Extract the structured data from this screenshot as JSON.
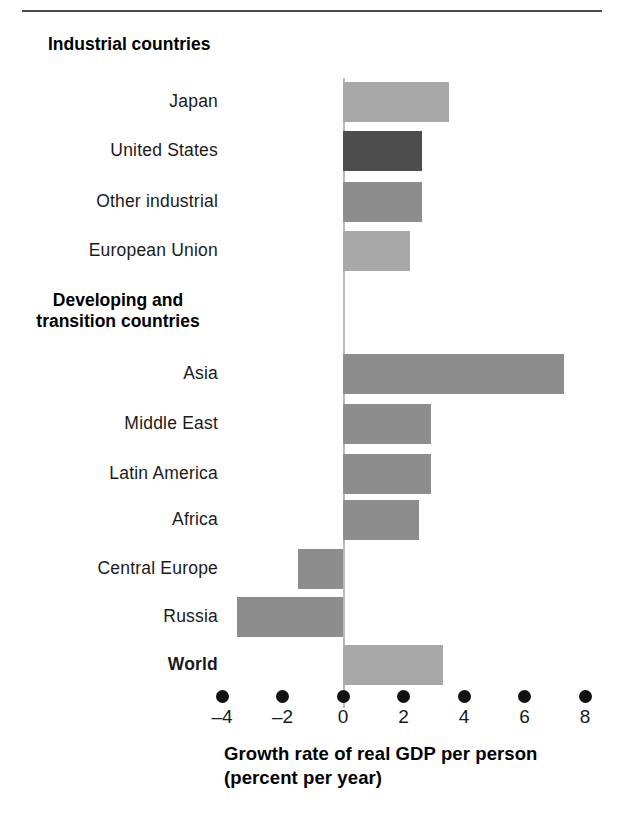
{
  "figure": {
    "axis_title_line1": "Growth rate of real GDP per person",
    "axis_title_line2": "(percent per year)",
    "group_headings": [
      {
        "id": "industrial",
        "text": "Industrial countries"
      },
      {
        "id": "developing",
        "line1": "Developing and",
        "line2": "transition countries"
      }
    ],
    "colors": {
      "bar_light": "#a8a8a8",
      "bar_medium": "#8d8d8d",
      "bar_dark": "#4d4d4d",
      "axis_line": "#b9b9b9",
      "rule": "#4c4c4c",
      "text": "#111111"
    }
  },
  "chart_data": {
    "type": "bar",
    "orientation": "horizontal",
    "title": "",
    "xlabel": "Growth rate of real GDP per person (percent per year)",
    "ylabel": "",
    "xlim": [
      -5,
      8.8
    ],
    "xticks": [
      -4,
      -2,
      0,
      2,
      4,
      6,
      8
    ],
    "xtick_labels": [
      "–4",
      "–2",
      "0",
      "2",
      "4",
      "6",
      "8"
    ],
    "grid": false,
    "legend": null,
    "categories": [
      "Japan",
      "United States",
      "Other industrial",
      "European Union",
      "Asia",
      "Middle East",
      "Latin America",
      "Africa",
      "Central Europe",
      "Russia",
      "World"
    ],
    "values": [
      3.5,
      2.6,
      2.6,
      2.2,
      7.3,
      2.9,
      2.9,
      2.5,
      -1.5,
      -3.5,
      3.3
    ],
    "bar_colors": [
      "#a8a8a8",
      "#4d4d4d",
      "#8d8d8d",
      "#a8a8a8",
      "#8d8d8d",
      "#8d8d8d",
      "#8d8d8d",
      "#8d8d8d",
      "#8d8d8d",
      "#8d8d8d",
      "#a8a8a8"
    ],
    "label_bold": [
      false,
      false,
      false,
      false,
      false,
      false,
      false,
      false,
      false,
      false,
      true
    ],
    "groups": [
      {
        "heading": "Industrial countries",
        "categories": [
          "Japan",
          "United States",
          "Other industrial",
          "European Union"
        ]
      },
      {
        "heading": "Developing and transition countries",
        "categories": [
          "Asia",
          "Middle East",
          "Latin America",
          "Africa",
          "Central Europe",
          "Russia"
        ]
      },
      {
        "heading": "",
        "categories": [
          "World"
        ]
      }
    ]
  },
  "rows": [
    {
      "label": "Japan",
      "value": 3.5,
      "top": 82,
      "bold": false,
      "shade": "light"
    },
    {
      "label": "United States",
      "value": 2.6,
      "top": 131,
      "bold": false,
      "shade": "dark"
    },
    {
      "label": "Other industrial",
      "value": 2.6,
      "top": 182,
      "bold": false,
      "shade": "medium"
    },
    {
      "label": "European Union",
      "value": 2.2,
      "top": 231,
      "bold": false,
      "shade": "light"
    },
    {
      "label": "Asia",
      "value": 7.3,
      "top": 354,
      "bold": false,
      "shade": "medium"
    },
    {
      "label": "Middle East",
      "value": 2.9,
      "top": 404,
      "bold": false,
      "shade": "medium"
    },
    {
      "label": "Latin America",
      "value": 2.9,
      "top": 454,
      "bold": false,
      "shade": "medium"
    },
    {
      "label": "Africa",
      "value": 2.5,
      "top": 500,
      "bold": false,
      "shade": "medium"
    },
    {
      "label": "Central Europe",
      "value": -1.5,
      "top": 549,
      "bold": false,
      "shade": "medium"
    },
    {
      "label": "Russia",
      "value": -3.5,
      "top": 597,
      "bold": false,
      "shade": "medium"
    },
    {
      "label": "World",
      "value": 3.3,
      "top": 645,
      "bold": true,
      "shade": "light"
    }
  ],
  "headings": [
    {
      "text": "Industrial countries",
      "top": 34
    },
    {
      "text": "Developing and",
      "top": 290
    },
    {
      "text": "transition countries",
      "top": 311
    }
  ]
}
